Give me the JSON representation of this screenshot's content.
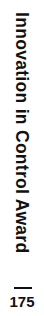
{
  "header": {
    "running_title": "Innovation in Control Award",
    "page_number": "175"
  },
  "colors": {
    "text": "#111111",
    "background": "#ffffff"
  }
}
